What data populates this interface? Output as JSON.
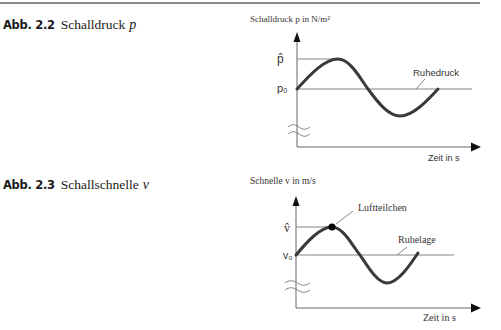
{
  "figures": [
    {
      "number": "Abb. 2.2",
      "title": "Schalldruck",
      "symbol": "p",
      "y_axis_label": "Schalldruck p in  N/m²",
      "x_axis_label": "Zeit in s",
      "amplitude_label": "p̂",
      "baseline_label": "p₀",
      "annotations": [
        "Ruhedruck"
      ],
      "colors": {
        "curve": "#3a3a3a",
        "lines": "#777777"
      }
    },
    {
      "number": "Abb. 2.3",
      "title": "Schallschnelle",
      "symbol": "v",
      "y_axis_label": "Schnelle v in  m/s",
      "x_axis_label": "Zeit in s",
      "amplitude_label": "v̂",
      "baseline_label": "v₀",
      "annotations": [
        "Luftteilchen",
        "Ruhelage"
      ],
      "colors": {
        "curve": "#3a3a3a",
        "lines": "#777777",
        "marker": "#000000"
      }
    }
  ]
}
